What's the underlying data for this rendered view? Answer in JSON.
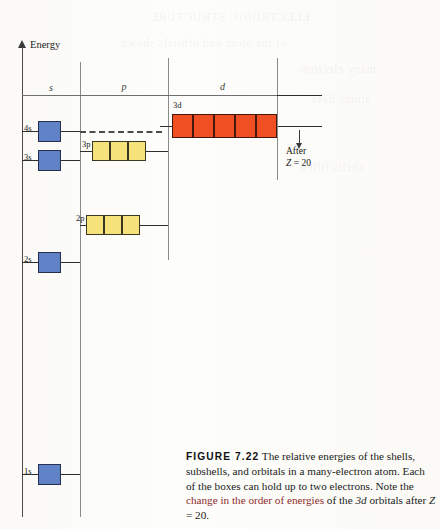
{
  "figure": {
    "axis": {
      "label": "Energy"
    },
    "columns": [
      {
        "name": "s-column-header",
        "label": "s"
      },
      {
        "name": "p-column-header",
        "label": "p"
      },
      {
        "name": "d-column-header",
        "label": "d"
      }
    ],
    "levels": [
      {
        "id": "4s",
        "label": "4s",
        "subshell": "s",
        "box_count": 1,
        "color": "#5f83c6"
      },
      {
        "id": "3s",
        "label": "3s",
        "subshell": "s",
        "box_count": 1,
        "color": "#5f83c6"
      },
      {
        "id": "2s",
        "label": "2s",
        "subshell": "s",
        "box_count": 1,
        "color": "#5f83c6"
      },
      {
        "id": "1s",
        "label": "1s",
        "subshell": "s",
        "box_count": 1,
        "color": "#5f83c6"
      },
      {
        "id": "3p",
        "label": "3p",
        "subshell": "p",
        "box_count": 3,
        "color": "#f6e27a"
      },
      {
        "id": "2p",
        "label": "2p",
        "subshell": "p",
        "box_count": 3,
        "color": "#f6e27a"
      },
      {
        "id": "3d",
        "label": "3d",
        "subshell": "d",
        "box_count": 5,
        "color": "#f04e23"
      }
    ],
    "annotation": {
      "line1": "After",
      "line2_var": "Z",
      "line2_eq": "= 20"
    }
  },
  "caption": {
    "figure_number": "FIGURE 7.22",
    "text_1": " The relative energies of the shells, subshells, and orbitals in a many-electron atom. Each of the boxes can hold up to two electrons. Note the ",
    "text_change": "change in the order of energies",
    "text_2": " of the ",
    "orbital": "3d",
    "text_3": " orbitals after ",
    "zvar": "Z",
    "text_4": " = 20."
  },
  "colors": {
    "s_box": "#5f83c6",
    "p_box": "#f6e27a",
    "d_box": "#f04e23",
    "rule": "#2e2e2e",
    "page": "#fdfcfa"
  }
}
